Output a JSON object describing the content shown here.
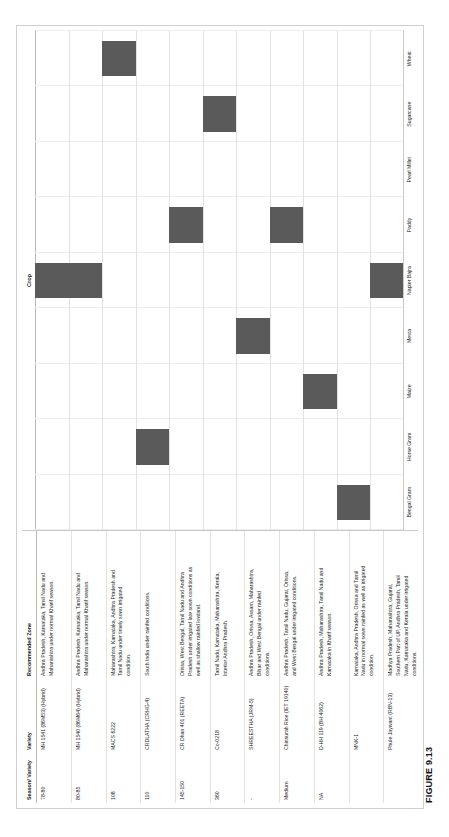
{
  "figure": {
    "caption": "FIGURE 9.13"
  },
  "table": {
    "headers": {
      "season": "Season/ Variety",
      "variety": "Variety",
      "zone": "Recommended Zone"
    },
    "rows": [
      {
        "season": "78-80",
        "variety": "MH 1541 (86M53) (Hybrid)",
        "zone": "Andhra Pradesh, Karnataka, Tamil Nadu and Maharashtra under normal Kharif season.",
        "value_label": "Value",
        "tick_high": "1",
        "tick_low": "0.5",
        "crop": "Napier Bajra"
      },
      {
        "season": "80-85",
        "variety": "MH 1540 (86M64) (Hybrid)",
        "zone": "Andhra Pradesh, Karnataka, Tamil Nadu and Maharashtra under normal Kharif season.",
        "value_label": "Value",
        "tick_high": "1",
        "tick_low": "0.5",
        "crop": "Napier Bajra"
      },
      {
        "season": "108",
        "variety": "MACS 6222",
        "zone": "Maharashtra, Karnataka, Andhra Pradesh and Tamil Nadu under timely sown irrigated condition.",
        "value_label": "Value",
        "tick_high": "1",
        "tick_low": "0.5",
        "crop": "Wheat"
      },
      {
        "season": "110",
        "variety": "CRDLATHA (CRHG-4)",
        "zone": "South India under rainfed conditions.",
        "value_label": "Value",
        "tick_high": "1",
        "tick_low": "0.5",
        "crop": "Horse Gram"
      },
      {
        "season": "145-150",
        "variety": "CR Dhan 401 (REETA)",
        "zone": "Orissa, West Bengal, Tamil Nadu and Andhra Pradesh under irrigated late sown conditions as well as shallow rainfed lowland.",
        "value_label": "Value",
        "tick_high": "1",
        "tick_low": "0.5",
        "crop": "Paddy"
      },
      {
        "season": "360",
        "variety": "Co-0218",
        "zone": "Tamil Nadu, Karnataka, Maharashtra, Kerala, Interior Andhra Pradesh.",
        "value_label": "Value",
        "tick_high": "1",
        "tick_low": "0.5",
        "crop": "Sugarcane"
      },
      {
        "season": "-",
        "variety": "SHREESTHA (JRM-5)",
        "zone": "Andhra Pradesh, Orissa, Assam, Maharashtra, Bihar and West Bengal under rainfed conditions.",
        "value_label": "Value",
        "tick_high": "1",
        "tick_low": "0.5",
        "crop": "Mesta"
      },
      {
        "season": "Medium",
        "variety": "Chinsurah Rice (IET 19140)",
        "zone": "Andhra Pradesh, Tamil Nadu, Gujarat, Orissa, and West Bengal under irrigated conditions.",
        "value_label": "Value",
        "tick_high": "1",
        "tick_low": "0.5",
        "crop": "Paddy"
      },
      {
        "season": "NA",
        "variety": "D-HH 119 (BH 4062)",
        "zone": "Andhra Pradesh, Maharashtra, Tamil Nadu and Karnataka in Kharif season.",
        "value_label": "Value",
        "tick_high": "1",
        "tick_low": "0.5",
        "crop": "Maize"
      },
      {
        "season": "",
        "variety": "MNK-1",
        "zone": "Karnataka, Andhra Pradesh, Orissa and Tamil Nadu in normal sown rainfed as well as irrigated condition.",
        "value_label": "Value",
        "tick_high": "1",
        "tick_low": "0.5",
        "crop": "Bengal Gram"
      },
      {
        "season": "",
        "variety": "Phule Jaywant (RBN-13)",
        "zone": "Madhya Pradesh, Maharashtra, Gujarat, Southern Part of UP, Andhra Pradesh, Tamil Nadu, Karnataka and Kerala under irrigated conditions.",
        "value_label": "Value",
        "tick_high": "1",
        "tick_low": "0.5",
        "crop": "Napier Bajra"
      }
    ]
  },
  "chart_data": {
    "type": "bar",
    "title": "Crop",
    "xlabel": "Crop",
    "ylabel": "Value",
    "ylim": [
      0,
      1
    ],
    "yticks": [
      "0.5",
      "1"
    ],
    "grid": true,
    "legend": "none",
    "bar_color": "#5a5a5a",
    "categories": [
      "Bengal Gram",
      "Horse Gram",
      "Maize",
      "Mesta",
      "Napier Bajra",
      "Paddy",
      "Pearl Millet",
      "Sugarcane",
      "Wheat"
    ],
    "series": [
      {
        "name": "MH 1541 (86M53) (Hybrid)",
        "crop": "Napier Bajra",
        "values": [
          0,
          0,
          0,
          0,
          1,
          0,
          0,
          0,
          0
        ]
      },
      {
        "name": "MH 1540 (86M64) (Hybrid)",
        "crop": "Napier Bajra",
        "values": [
          0,
          0,
          0,
          0,
          1,
          0,
          0,
          0,
          0
        ]
      },
      {
        "name": "MACS 6222",
        "crop": "Wheat",
        "values": [
          0,
          0,
          0,
          0,
          0,
          0,
          0,
          0,
          1
        ]
      },
      {
        "name": "CRDLATHA (CRHG-4)",
        "crop": "Horse Gram",
        "values": [
          0,
          1,
          0,
          0,
          0,
          0,
          0,
          0,
          0
        ]
      },
      {
        "name": "CR Dhan 401 (REETA)",
        "crop": "Paddy",
        "values": [
          0,
          0,
          0,
          0,
          0,
          1,
          0,
          0,
          0
        ]
      },
      {
        "name": "Co-0218",
        "crop": "Sugarcane",
        "values": [
          0,
          0,
          0,
          0,
          0,
          0,
          0,
          1,
          0
        ]
      },
      {
        "name": "SHREESTHA (JRM-5)",
        "crop": "Mesta",
        "values": [
          0,
          0,
          0,
          1,
          0,
          0,
          0,
          0,
          0
        ]
      },
      {
        "name": "Chinsurah Rice (IET 19140)",
        "crop": "Paddy",
        "values": [
          0,
          0,
          0,
          0,
          0,
          1,
          0,
          0,
          0
        ]
      },
      {
        "name": "D-HH 119 (BH 4062)",
        "crop": "Maize",
        "values": [
          0,
          0,
          1,
          0,
          0,
          0,
          0,
          0,
          0
        ]
      },
      {
        "name": "MNK-1",
        "crop": "Bengal Gram",
        "values": [
          1,
          0,
          0,
          0,
          0,
          0,
          0,
          0,
          0
        ]
      },
      {
        "name": "Phule Jaywant (RBN-13)",
        "crop": "Napier Bajra",
        "values": [
          0,
          0,
          0,
          0,
          1,
          0,
          0,
          0,
          0
        ]
      }
    ]
  }
}
